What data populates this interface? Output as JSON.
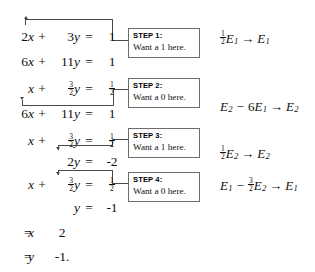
{
  "figure": {
    "equation_rows": [
      {
        "id": "r1",
        "coef": "2",
        "var1": "x",
        "op": "+",
        "coef2": "3",
        "var2": "y",
        "eq": "=",
        "rhs": "1"
      },
      {
        "id": "r2",
        "coef": "6",
        "var1": "x",
        "op": "+",
        "coef2": "11",
        "var2": "y",
        "eq": "=",
        "rhs": "1"
      },
      {
        "id": "r3",
        "coef": "",
        "var1": "x",
        "op": "+",
        "coef2": "3/2",
        "var2": "y",
        "eq": "=",
        "rhs": "1/2"
      },
      {
        "id": "r4",
        "coef": "6",
        "var1": "x",
        "op": "+",
        "coef2": "11",
        "var2": "y",
        "eq": "=",
        "rhs": "1"
      },
      {
        "id": "r5",
        "coef": "",
        "var1": "x",
        "op": "+",
        "coef2": "3/2",
        "var2": "y",
        "eq": "=",
        "rhs": "1/2"
      },
      {
        "id": "r6",
        "coef": "",
        "var1": "",
        "op": "",
        "coef2": "2",
        "var2": "y",
        "eq": "=",
        "rhs": "-2"
      },
      {
        "id": "r7",
        "coef": "",
        "var1": "x",
        "op": "+",
        "coef2": "3/2",
        "var2": "y",
        "eq": "=",
        "rhs": "1/2"
      },
      {
        "id": "r8",
        "coef": "",
        "var1": "",
        "op": "",
        "coef2": "",
        "var2": "y",
        "eq": "=",
        "rhs": "-1"
      },
      {
        "id": "r9",
        "coef": "",
        "var1": "x",
        "op": "",
        "coef2": "",
        "var2": "",
        "eq": "=",
        "rhs": "2"
      },
      {
        "id": "r10",
        "coef": "",
        "var1": "y",
        "op": "",
        "coef2": "",
        "var2": "",
        "eq": "=",
        "rhs": "-1."
      }
    ],
    "fractions": {
      "three_halves": {
        "numerator": "3",
        "denominator": "2"
      },
      "one_half": {
        "numerator": "1",
        "denominator": "2"
      }
    },
    "steps": [
      {
        "id": "step1",
        "label": "STEP 1:",
        "instruction": "Want a 1 here."
      },
      {
        "id": "step2",
        "label": "STEP 2:",
        "instruction": "Want a 0 here."
      },
      {
        "id": "step3",
        "label": "STEP 3:",
        "instruction": "Want a 1 here."
      },
      {
        "id": "step4",
        "label": "STEP 4:",
        "instruction": "Want a 0 here."
      }
    ],
    "operations": [
      {
        "id": "op1",
        "scalar": "1/2",
        "source": "E",
        "source_sub": "1",
        "arrow": "→",
        "target": "E",
        "target_sub": "1",
        "text": "½E₁ → E₁"
      },
      {
        "id": "op2",
        "lead": "E",
        "lead_sub": "2",
        "minus": "−",
        "scalar": "6",
        "source": "E",
        "source_sub": "1",
        "arrow": "→",
        "target": "E",
        "target_sub": "2",
        "text": "E₂ − 6E₁ → E₂"
      },
      {
        "id": "op3",
        "scalar": "1/2",
        "source": "E",
        "source_sub": "2",
        "arrow": "→",
        "target": "E",
        "target_sub": "2",
        "text": "½E₂ → E₂"
      },
      {
        "id": "op4",
        "lead": "E",
        "lead_sub": "1",
        "minus": "−",
        "scalar": "3/2",
        "source": "E",
        "source_sub": "2",
        "arrow": "→",
        "target": "E",
        "target_sub": "1",
        "text": "E₁ − (3/2)E₂ → E₁"
      }
    ],
    "symbols": {
      "plus": "+",
      "equals": "=",
      "minus": "−",
      "arrow": "→",
      "x": "x",
      "y": "y",
      "E": "E"
    },
    "colors": {
      "ink": "#111111",
      "rule": "#4a4a4a",
      "box_border": "#6d6d6d",
      "background": "#ffffff"
    }
  }
}
